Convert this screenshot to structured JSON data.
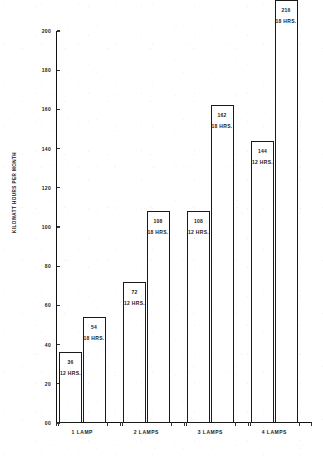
{
  "chart_data": {
    "type": "bar",
    "title": "",
    "xlabel": "",
    "ylabel": "KILOWATT HOURS PER MONTH",
    "ylim": [
      0,
      200
    ],
    "grid": false,
    "legend": "none",
    "categories": [
      "1 LAMP",
      "2 LAMPS",
      "3 LAMPS",
      "4 LAMPS"
    ],
    "series": [
      {
        "name": "12 HRS.",
        "values": [
          36,
          72,
          108,
          144
        ]
      },
      {
        "name": "18 HRS.",
        "values": [
          54,
          108,
          162,
          216
        ]
      }
    ],
    "y_ticks": [
      "00",
      "20",
      "40",
      "60",
      "80",
      "100",
      "120",
      "140",
      "160",
      "180",
      "200"
    ],
    "y_tick_values": [
      0,
      20,
      40,
      60,
      80,
      100,
      120,
      140,
      160,
      180,
      200
    ],
    "bars": [
      {
        "group": "1 LAMP",
        "hours": "12 HRS.",
        "value": 36,
        "value_label": "36"
      },
      {
        "group": "1 LAMP",
        "hours": "18 HRS.",
        "value": 54,
        "value_label": "54"
      },
      {
        "group": "2 LAMPS",
        "hours": "12 HRS.",
        "value": 72,
        "value_label": "72"
      },
      {
        "group": "2 LAMPS",
        "hours": "18 HRS.",
        "value": 108,
        "value_label": "108"
      },
      {
        "group": "3 LAMPS",
        "hours": "12 HRS.",
        "value": 108,
        "value_label": "108"
      },
      {
        "group": "3 LAMPS",
        "hours": "18 HRS.",
        "value": 162,
        "value_label": "162"
      },
      {
        "group": "4 LAMPS",
        "hours": "12 HRS.",
        "value": 144,
        "value_label": "144"
      },
      {
        "group": "4 LAMPS",
        "hours": "18 HRS.",
        "value": 216,
        "value_label": "216"
      }
    ],
    "colors": {
      "ink": "#1a1a1a",
      "bar_fill": "#ffffff",
      "background": "#ffffff"
    }
  }
}
